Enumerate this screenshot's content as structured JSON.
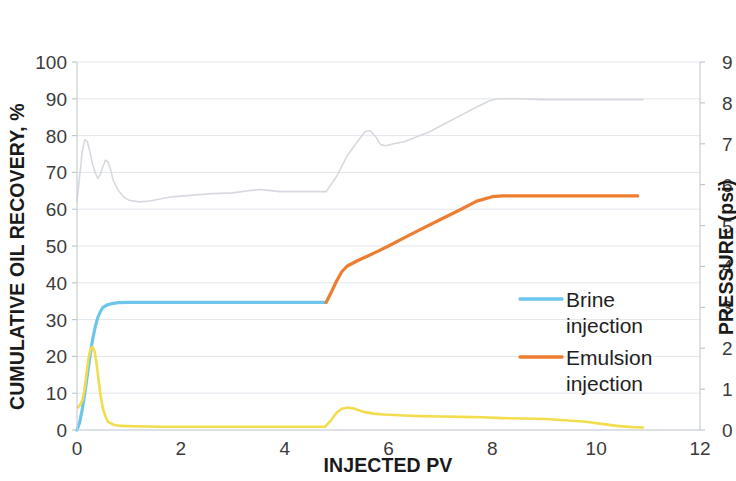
{
  "chart_data": {
    "type": "line",
    "title": "",
    "xlabel": "INJECTED PV",
    "ylabel": "CUMULATIVE OIL RECOVERY, %",
    "y2label": "PRESSURE (psi)",
    "xlim": [
      0,
      12
    ],
    "ylim": [
      0,
      100
    ],
    "y2lim": [
      0,
      9
    ],
    "xticks": [
      "0",
      "2",
      "4",
      "6",
      "8",
      "10",
      "12"
    ],
    "yticks": [
      "0",
      "10",
      "20",
      "30",
      "40",
      "50",
      "60",
      "70",
      "80",
      "90",
      "100"
    ],
    "y2ticks": [
      "0",
      "1",
      "2",
      "3",
      "4",
      "5",
      "6",
      "7",
      "8",
      "9"
    ],
    "grid": true,
    "legend_position": "center-right",
    "colors": {
      "brine": "#6CC6EB",
      "emulsion": "#ED7D31",
      "pressure_brine": "#D6D9E0",
      "pressure_emulsion": "#F2DD4E"
    },
    "series": [
      {
        "name": "Brine injection",
        "axis": "left",
        "color": "#6CC6EB",
        "in_legend": true,
        "points": [
          [
            0.0,
            0.0
          ],
          [
            0.05,
            2.0
          ],
          [
            0.1,
            5.5
          ],
          [
            0.15,
            10.0
          ],
          [
            0.2,
            15.0
          ],
          [
            0.25,
            20.0
          ],
          [
            0.3,
            24.5
          ],
          [
            0.35,
            28.0
          ],
          [
            0.4,
            30.5
          ],
          [
            0.45,
            32.2
          ],
          [
            0.5,
            33.3
          ],
          [
            0.6,
            34.1
          ],
          [
            0.7,
            34.4
          ],
          [
            0.8,
            34.6
          ],
          [
            1.0,
            34.7
          ],
          [
            1.5,
            34.7
          ],
          [
            2.0,
            34.7
          ],
          [
            2.5,
            34.7
          ],
          [
            3.0,
            34.7
          ],
          [
            3.5,
            34.7
          ],
          [
            4.0,
            34.7
          ],
          [
            4.5,
            34.7
          ],
          [
            4.8,
            34.7
          ]
        ]
      },
      {
        "name": "Emulsion injection",
        "axis": "left",
        "color": "#ED7D31",
        "in_legend": true,
        "points": [
          [
            4.8,
            34.7
          ],
          [
            4.9,
            37.5
          ],
          [
            5.0,
            40.5
          ],
          [
            5.1,
            43.0
          ],
          [
            5.2,
            44.5
          ],
          [
            5.4,
            46.0
          ],
          [
            5.6,
            47.3
          ],
          [
            5.8,
            48.6
          ],
          [
            6.0,
            50.0
          ],
          [
            6.3,
            52.2
          ],
          [
            6.6,
            54.4
          ],
          [
            7.0,
            57.2
          ],
          [
            7.4,
            60.0
          ],
          [
            7.7,
            62.2
          ],
          [
            8.0,
            63.4
          ],
          [
            8.2,
            63.6
          ],
          [
            9.0,
            63.6
          ],
          [
            10.0,
            63.6
          ],
          [
            10.8,
            63.6
          ]
        ]
      },
      {
        "name": "Pressure (brine stage)",
        "axis": "right",
        "color": "#D6D9E0",
        "in_legend": false,
        "points": [
          [
            0.0,
            5.6
          ],
          [
            0.05,
            6.2
          ],
          [
            0.1,
            6.8
          ],
          [
            0.15,
            7.1
          ],
          [
            0.2,
            7.05
          ],
          [
            0.25,
            6.8
          ],
          [
            0.3,
            6.5
          ],
          [
            0.35,
            6.3
          ],
          [
            0.4,
            6.15
          ],
          [
            0.45,
            6.25
          ],
          [
            0.5,
            6.45
          ],
          [
            0.55,
            6.6
          ],
          [
            0.6,
            6.55
          ],
          [
            0.65,
            6.35
          ],
          [
            0.7,
            6.1
          ],
          [
            0.8,
            5.85
          ],
          [
            0.9,
            5.7
          ],
          [
            1.0,
            5.62
          ],
          [
            1.2,
            5.58
          ],
          [
            1.4,
            5.6
          ],
          [
            1.6,
            5.65
          ],
          [
            1.8,
            5.7
          ],
          [
            2.0,
            5.72
          ],
          [
            2.3,
            5.75
          ],
          [
            2.6,
            5.78
          ],
          [
            3.0,
            5.8
          ],
          [
            3.3,
            5.85
          ],
          [
            3.5,
            5.88
          ],
          [
            3.7,
            5.86
          ],
          [
            3.9,
            5.83
          ],
          [
            4.2,
            5.83
          ],
          [
            4.5,
            5.83
          ],
          [
            4.8,
            5.83
          ]
        ]
      },
      {
        "name": "Pressure (emulsion stage)",
        "axis": "right",
        "color": "#D6D9E0",
        "in_legend": false,
        "points": [
          [
            4.8,
            5.83
          ],
          [
            5.0,
            6.2
          ],
          [
            5.2,
            6.7
          ],
          [
            5.4,
            7.05
          ],
          [
            5.55,
            7.3
          ],
          [
            5.65,
            7.32
          ],
          [
            5.75,
            7.18
          ],
          [
            5.85,
            6.98
          ],
          [
            5.95,
            6.95
          ],
          [
            6.1,
            7.0
          ],
          [
            6.3,
            7.05
          ],
          [
            6.5,
            7.15
          ],
          [
            6.8,
            7.3
          ],
          [
            7.1,
            7.5
          ],
          [
            7.4,
            7.7
          ],
          [
            7.7,
            7.9
          ],
          [
            7.95,
            8.05
          ],
          [
            8.1,
            8.1
          ],
          [
            8.5,
            8.1
          ],
          [
            9.0,
            8.08
          ],
          [
            9.5,
            8.08
          ],
          [
            10.0,
            8.08
          ],
          [
            10.5,
            8.08
          ],
          [
            10.9,
            8.08
          ]
        ]
      },
      {
        "name": "Differential pressure",
        "axis": "right",
        "color": "#F2DD4E",
        "in_legend": false,
        "points": [
          [
            0.02,
            0.55
          ],
          [
            0.06,
            0.62
          ],
          [
            0.1,
            0.72
          ],
          [
            0.14,
            0.95
          ],
          [
            0.18,
            1.35
          ],
          [
            0.22,
            1.75
          ],
          [
            0.26,
            1.98
          ],
          [
            0.3,
            2.03
          ],
          [
            0.34,
            1.92
          ],
          [
            0.38,
            1.6
          ],
          [
            0.42,
            1.18
          ],
          [
            0.46,
            0.8
          ],
          [
            0.5,
            0.52
          ],
          [
            0.55,
            0.32
          ],
          [
            0.6,
            0.2
          ],
          [
            0.7,
            0.13
          ],
          [
            0.85,
            0.1
          ],
          [
            1.1,
            0.09
          ],
          [
            1.6,
            0.08
          ],
          [
            2.2,
            0.08
          ],
          [
            3.0,
            0.08
          ],
          [
            3.8,
            0.08
          ],
          [
            4.5,
            0.08
          ],
          [
            4.78,
            0.08
          ],
          [
            4.9,
            0.25
          ],
          [
            5.0,
            0.42
          ],
          [
            5.1,
            0.52
          ],
          [
            5.22,
            0.55
          ],
          [
            5.35,
            0.52
          ],
          [
            5.5,
            0.45
          ],
          [
            5.7,
            0.4
          ],
          [
            5.9,
            0.38
          ],
          [
            6.2,
            0.36
          ],
          [
            6.6,
            0.34
          ],
          [
            7.0,
            0.33
          ],
          [
            7.4,
            0.32
          ],
          [
            7.8,
            0.31
          ],
          [
            8.2,
            0.29
          ],
          [
            8.6,
            0.28
          ],
          [
            9.0,
            0.27
          ],
          [
            9.4,
            0.24
          ],
          [
            9.8,
            0.2
          ],
          [
            10.1,
            0.15
          ],
          [
            10.4,
            0.1
          ],
          [
            10.7,
            0.07
          ],
          [
            10.9,
            0.06
          ]
        ]
      }
    ],
    "legend": [
      {
        "label_line1": "Brine",
        "label_line2": "injection",
        "color": "#6CC6EB"
      },
      {
        "label_line1": "Emulsion",
        "label_line2": "injection",
        "color": "#ED7D31"
      }
    ]
  }
}
